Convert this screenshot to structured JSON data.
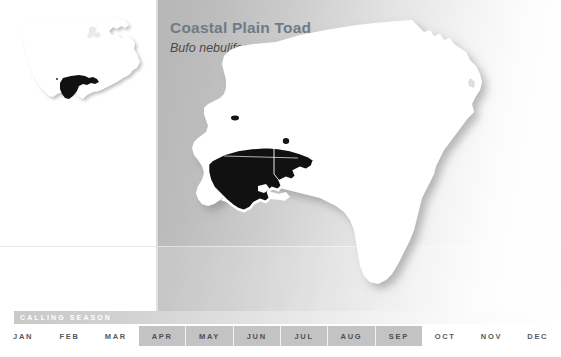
{
  "map_card": {
    "title": "Coastal Plain Toad",
    "scientific_name": "Bufo nebulifer",
    "colors": {
      "title_text": "#6e7b85",
      "subtitle_text": "#4a4a4a",
      "range_fill": "#111111",
      "land_fill": "#ffffff",
      "panel_gray": "#b6b6b6",
      "highlight_gray": "#c3c3c3",
      "month_text": "#59595c"
    }
  },
  "inset_map": {
    "name": "united-states-locator-map",
    "land_label": "United States",
    "range_label": "species range"
  },
  "main_map": {
    "name": "southeastern-united-states-range-map",
    "region_label": "Southeastern United States",
    "range_label": "Coastal Plain Toad range"
  },
  "calling_season": {
    "label": "CALLING SEASON",
    "months": [
      {
        "label": "JAN",
        "active": false
      },
      {
        "label": "FEB",
        "active": false
      },
      {
        "label": "MAR",
        "active": false
      },
      {
        "label": "APR",
        "active": true
      },
      {
        "label": "MAY",
        "active": true
      },
      {
        "label": "JUN",
        "active": true
      },
      {
        "label": "JUL",
        "active": true
      },
      {
        "label": "AUG",
        "active": true
      },
      {
        "label": "SEP",
        "active": true
      },
      {
        "label": "OCT",
        "active": false
      },
      {
        "label": "NOV",
        "active": false
      },
      {
        "label": "DEC",
        "active": false
      }
    ],
    "active_range": "APR-SEP"
  }
}
